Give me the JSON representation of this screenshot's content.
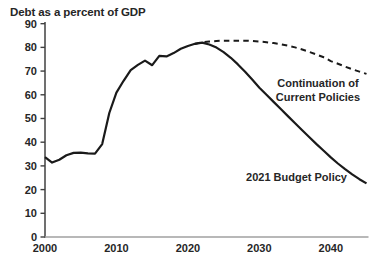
{
  "colors": {
    "series_line": "#1a1a1a",
    "y_axis": "#404040",
    "x_axis": "#a0a0a0",
    "text": "#262626",
    "background": "#ffffff"
  },
  "chart_data": {
    "type": "line",
    "title": "Debt as a percent of GDP",
    "title_position": "top-left",
    "xlabel": "",
    "ylabel": "",
    "xlim": [
      2000,
      2045
    ],
    "ylim": [
      0,
      90
    ],
    "x_ticks": [
      2000,
      2010,
      2020,
      2030,
      2040
    ],
    "y_ticks": [
      0,
      10,
      20,
      30,
      40,
      50,
      60,
      70,
      80,
      90
    ],
    "grid": false,
    "legend": "inline-annotations",
    "series": [
      {
        "name": "2021 Budget Policy",
        "style": "solid",
        "x": [
          2000,
          2001,
          2002,
          2003,
          2004,
          2005,
          2006,
          2007,
          2008,
          2009,
          2010,
          2011,
          2012,
          2013,
          2014,
          2015,
          2016,
          2017,
          2018,
          2019,
          2020,
          2021,
          2022,
          2023,
          2024,
          2025,
          2026,
          2027,
          2028,
          2029,
          2030,
          2031,
          2032,
          2033,
          2034,
          2035,
          2036,
          2037,
          2038,
          2039,
          2040,
          2041,
          2042,
          2043,
          2044,
          2045
        ],
        "values": [
          33.7,
          31.4,
          32.6,
          34.5,
          35.5,
          35.6,
          35.3,
          35.2,
          39.2,
          52.3,
          60.9,
          65.9,
          70.4,
          72.6,
          74.4,
          72.5,
          76.4,
          76.2,
          77.6,
          79.4,
          80.6,
          81.5,
          82.0,
          81.2,
          79.9,
          78.0,
          75.6,
          72.8,
          69.7,
          66.4,
          63.0,
          60.0,
          57.0,
          54.0,
          51.0,
          48.0,
          45.0,
          42.1,
          39.2,
          36.4,
          33.6,
          31.0,
          28.6,
          26.4,
          24.4,
          22.6
        ]
      },
      {
        "name": "Continuation of Current Policies",
        "style": "dashed",
        "x": [
          2021,
          2022,
          2023,
          2024,
          2025,
          2026,
          2027,
          2028,
          2029,
          2030,
          2031,
          2032,
          2033,
          2034,
          2035,
          2036,
          2037,
          2038,
          2039,
          2040,
          2041,
          2042,
          2043,
          2044,
          2045
        ],
        "values": [
          81.5,
          82.2,
          82.5,
          82.7,
          82.8,
          82.8,
          82.8,
          82.8,
          82.7,
          82.5,
          82.2,
          81.8,
          81.3,
          80.7,
          80.0,
          79.1,
          78.1,
          77.0,
          75.8,
          74.2,
          73.1,
          71.9,
          70.8,
          69.8,
          68.8
        ]
      }
    ],
    "annotations": [
      {
        "lines": [
          "Continuation of",
          "Current Policies"
        ],
        "year": 2038.2,
        "value": 64.3
      },
      {
        "lines": [
          "2021 Budget Policy"
        ],
        "year": 2035.2,
        "value": 24.9
      }
    ]
  }
}
